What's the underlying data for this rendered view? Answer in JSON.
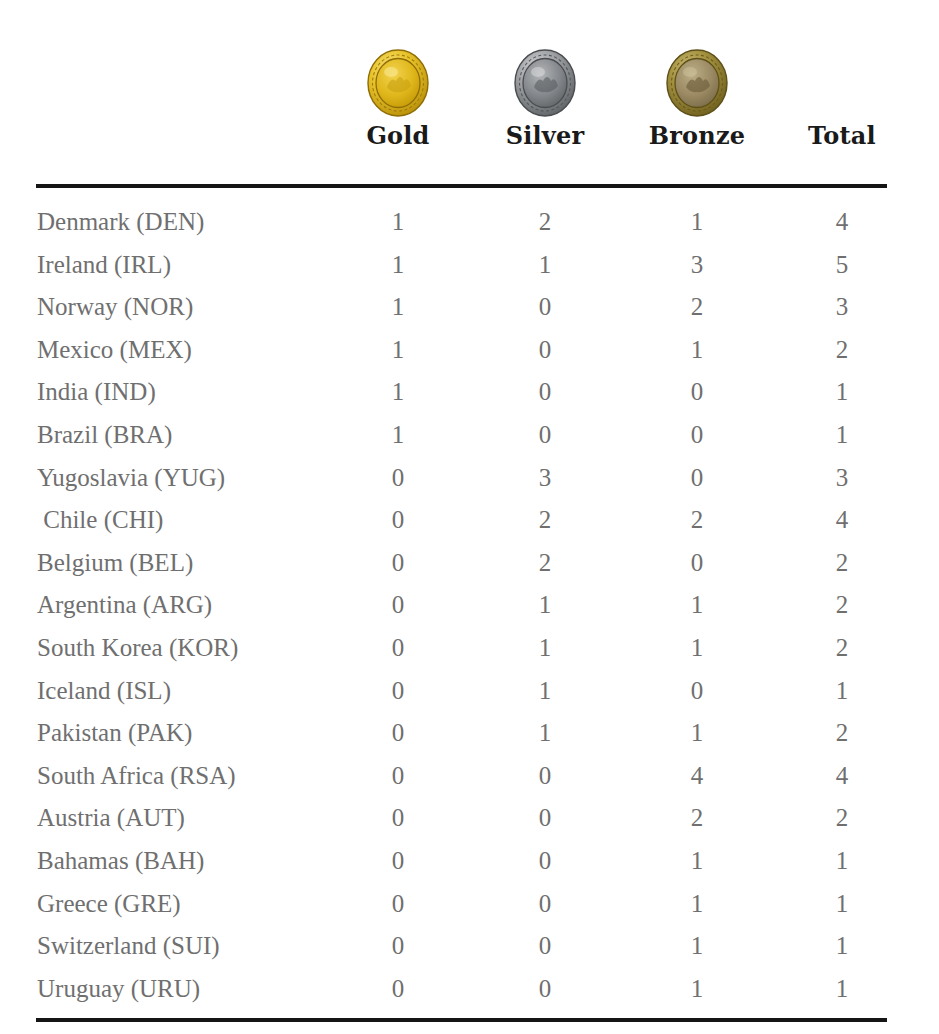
{
  "table": {
    "columns": [
      {
        "key": "country",
        "label": "",
        "icon": "none"
      },
      {
        "key": "gold",
        "label": "Gold",
        "icon": "gold-medal-icon",
        "color": "#e3b60f"
      },
      {
        "key": "silver",
        "label": "Silver",
        "icon": "silver-medal-icon",
        "color": "#9a9a9c"
      },
      {
        "key": "bronze",
        "label": "Bronze",
        "icon": "bronze-medal-icon",
        "color": "#8c7a3a"
      },
      {
        "key": "total",
        "label": "Total",
        "icon": "none"
      }
    ],
    "rows": [
      {
        "country": "Denmark (DEN)",
        "gold": "1",
        "silver": "2",
        "bronze": "1",
        "total": "4"
      },
      {
        "country": "Ireland (IRL)",
        "gold": "1",
        "silver": "1",
        "bronze": "3",
        "total": "5"
      },
      {
        "country": "Norway (NOR)",
        "gold": "1",
        "silver": "0",
        "bronze": "2",
        "total": "3"
      },
      {
        "country": "Mexico (MEX)",
        "gold": "1",
        "silver": "0",
        "bronze": "1",
        "total": "2"
      },
      {
        "country": "India (IND)",
        "gold": "1",
        "silver": "0",
        "bronze": "0",
        "total": "1"
      },
      {
        "country": "Brazil (BRA)",
        "gold": "1",
        "silver": "0",
        "bronze": "0",
        "total": "1"
      },
      {
        "country": "Yugoslavia (YUG)",
        "gold": "0",
        "silver": "3",
        "bronze": "0",
        "total": "3"
      },
      {
        "country": " Chile (CHI)",
        "gold": "0",
        "silver": "2",
        "bronze": "2",
        "total": "4"
      },
      {
        "country": "Belgium (BEL)",
        "gold": "0",
        "silver": "2",
        "bronze": "0",
        "total": "2"
      },
      {
        "country": "Argentina (ARG)",
        "gold": "0",
        "silver": "1",
        "bronze": "1",
        "total": "2"
      },
      {
        "country": "South Korea (KOR)",
        "gold": "0",
        "silver": "1",
        "bronze": "1",
        "total": "2"
      },
      {
        "country": "Iceland (ISL)",
        "gold": "0",
        "silver": "1",
        "bronze": "0",
        "total": "1"
      },
      {
        "country": "Pakistan (PAK)",
        "gold": "0",
        "silver": "1",
        "bronze": "1",
        "total": "2"
      },
      {
        "country": "South Africa (RSA)",
        "gold": "0",
        "silver": "0",
        "bronze": "4",
        "total": "4"
      },
      {
        "country": "Austria (AUT)",
        "gold": "0",
        "silver": "0",
        "bronze": "2",
        "total": "2"
      },
      {
        "country": "Bahamas (BAH)",
        "gold": "0",
        "silver": "0",
        "bronze": "1",
        "total": "1"
      },
      {
        "country": "Greece (GRE)",
        "gold": "0",
        "silver": "0",
        "bronze": "1",
        "total": "1"
      },
      {
        "country": "Switzerland (SUI)",
        "gold": "0",
        "silver": "0",
        "bronze": "1",
        "total": "1"
      },
      {
        "country": "Uruguay (URU)",
        "gold": "0",
        "silver": "0",
        "bronze": "1",
        "total": "1"
      }
    ]
  },
  "style": {
    "rule_color": "#151515",
    "body_text_color": "#6f6f70",
    "header_text_color": "#1a1a1a",
    "background": "#ffffff"
  }
}
